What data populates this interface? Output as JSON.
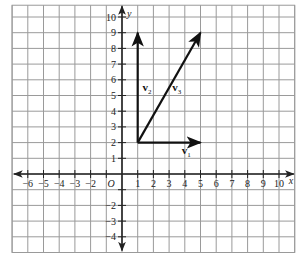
{
  "chart_data": {
    "type": "vector-plot",
    "title": "",
    "xlabel": "x",
    "ylabel": "y",
    "xlim": [
      -7,
      11
    ],
    "ylim": [
      -5,
      10.75
    ],
    "grid": true,
    "x_ticks": [
      -6,
      -5,
      -4,
      -3,
      -2,
      1,
      2,
      3,
      4,
      5,
      6,
      7,
      8,
      9,
      10
    ],
    "x_tick_labels": [
      "−6",
      "−5",
      "−4",
      "−3",
      "−2",
      "1",
      "2",
      "3",
      "4",
      "5",
      "6",
      "7",
      "8",
      "9",
      "10"
    ],
    "y_ticks": [
      10,
      9,
      8,
      7,
      6,
      5,
      4,
      3,
      2,
      1,
      -2,
      -3,
      -4
    ],
    "y_tick_labels": [
      "10",
      "9",
      "8",
      "7",
      "6",
      "5",
      "4",
      "3",
      "2",
      "1",
      "−2",
      "−3",
      "−4"
    ],
    "origin_label": "O",
    "vectors": [
      {
        "name": "v1",
        "label": "v",
        "subscript": "1",
        "start": [
          1,
          2
        ],
        "end": [
          5,
          2
        ],
        "label_pos": [
          3.8,
          1.3
        ]
      },
      {
        "name": "v2",
        "label": "v",
        "subscript": "2",
        "start": [
          1,
          2
        ],
        "end": [
          1,
          9
        ],
        "label_pos": [
          1.3,
          5.3
        ]
      },
      {
        "name": "v3",
        "label": "v",
        "subscript": "3",
        "start": [
          1,
          2
        ],
        "end": [
          5,
          9
        ],
        "label_pos": [
          3.2,
          5.3
        ]
      }
    ]
  },
  "colors": {
    "grid": "#9a9a9a",
    "axis": "#222222",
    "vector": "#111111",
    "background": "#ffffff"
  }
}
